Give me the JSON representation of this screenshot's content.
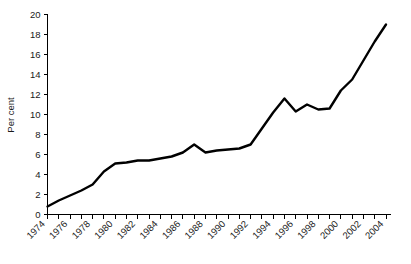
{
  "chart_data": {
    "type": "line",
    "title": "",
    "xlabel": "",
    "ylabel": "Per cent",
    "xlim": [
      1974,
      2004
    ],
    "ylim": [
      0,
      20
    ],
    "yticks": [
      0,
      2,
      4,
      6,
      8,
      10,
      12,
      14,
      16,
      18,
      20
    ],
    "ytick_labels": [
      "0",
      "2",
      "4",
      "6",
      "8",
      "10",
      "12",
      "14",
      "16",
      "18",
      "20"
    ],
    "xticks": [
      1974,
      1976,
      1978,
      1980,
      1982,
      1984,
      1986,
      1988,
      1990,
      1992,
      1994,
      1996,
      1998,
      2000,
      2002,
      2004
    ],
    "xtick_labels": [
      "1974",
      "1976",
      "1978",
      "1980",
      "1982",
      "1984",
      "1986",
      "1988",
      "1990",
      "1992",
      "1994",
      "1996",
      "1998",
      "2000",
      "2002",
      "2004"
    ],
    "xtick_minor_step": 1,
    "grid": false,
    "legend": false,
    "line_color": "#000000",
    "x": [
      1974,
      1975,
      1976,
      1977,
      1978,
      1979,
      1980,
      1981,
      1982,
      1983,
      1984,
      1985,
      1986,
      1987,
      1988,
      1989,
      1990,
      1991,
      1992,
      1993,
      1994,
      1995,
      1996,
      1997,
      1998,
      1999,
      2000,
      2001,
      2002,
      2003,
      2004
    ],
    "values": [
      0.8,
      1.4,
      1.9,
      2.4,
      3.0,
      4.3,
      5.1,
      5.2,
      5.4,
      5.4,
      5.6,
      5.8,
      6.2,
      7.0,
      6.2,
      6.4,
      6.5,
      6.6,
      7.0,
      8.6,
      10.2,
      11.6,
      10.3,
      11.0,
      10.5,
      10.6,
      12.4,
      13.5,
      15.4,
      17.3,
      19.0
    ],
    "series": [
      {
        "name": "",
        "values": [
          0.8,
          1.4,
          1.9,
          2.4,
          3.0,
          4.3,
          5.1,
          5.2,
          5.4,
          5.4,
          5.6,
          5.8,
          6.2,
          7.0,
          6.2,
          6.4,
          6.5,
          6.6,
          7.0,
          8.6,
          10.2,
          11.6,
          10.3,
          11.0,
          10.5,
          10.6,
          12.4,
          13.5,
          15.4,
          17.3,
          19.0
        ]
      }
    ]
  }
}
